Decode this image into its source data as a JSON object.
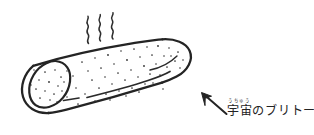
{
  "page": {
    "kind": "hand-drawn-sketch",
    "background_color": "#ffffff",
    "ink_color": "#262626",
    "width": 314,
    "height": 135
  },
  "caption": {
    "ruby_text": "うちゅう",
    "main_text": "宇宙のブリトー",
    "ink_color": "#232323"
  },
  "annotation": {
    "arrow_name": "pointer-arrow",
    "arrow_tip": "202,93",
    "arrow_tail": "227,114"
  },
  "drawing": {
    "subject_name": "burrito",
    "steam_count": 3,
    "steam_label": "steam-squiggles",
    "cut_face_label": "burrito-open-end",
    "seam_label": "burrito-fold-seam",
    "speckle_label": "tortilla-speckles"
  }
}
